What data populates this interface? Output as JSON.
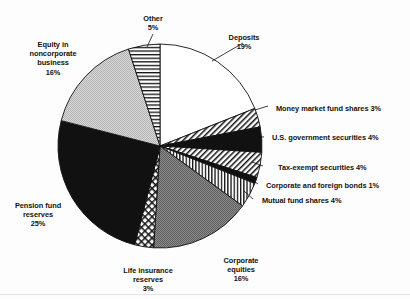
{
  "chart_data": {
    "type": "pie",
    "title": "",
    "subtitle": "",
    "xlabel": "",
    "ylabel": "",
    "legend_position": "callout-labels",
    "grid": false,
    "start_angle_deg": -90,
    "direction": "clockwise",
    "total_pct": 100,
    "categories": [
      "Deposits",
      "Money market fund shares",
      "U.S. government securities",
      "Tax-exempt securities",
      "Corporate and foreign bonds",
      "Mutual fund shares",
      "Corporate equities",
      "Life insurance reserves",
      "Pension fund reserves",
      "Equity in noncorporate business",
      "Other"
    ],
    "values": [
      19,
      3,
      4,
      4,
      1,
      4,
      16,
      3,
      25,
      16,
      5
    ],
    "value_labels": [
      "19%",
      "3%",
      "4%",
      "4%",
      "1%",
      "4%",
      "16%",
      "3%",
      "25%",
      "16%",
      "5%"
    ],
    "slice_fills": [
      "white",
      "diagonal-hatch",
      "solid-black",
      "diagonal-hatch",
      "solid-black",
      "vertical-lines",
      "mid-gray",
      "crosshatch",
      "solid-black",
      "light-gray",
      "horizontal-lines"
    ],
    "colors": {
      "white": "#ffffff",
      "light_gray": "#c9c9c9",
      "mid_gray": "#808080",
      "black": "#111111",
      "outline": "#111111"
    }
  },
  "labels": {
    "deposits": {
      "name": "Deposits",
      "pct": "19%"
    },
    "money_market": {
      "text": "Money market fund shares 3%"
    },
    "us_government": {
      "text": "U.S. government securities 4%"
    },
    "tax_exempt": {
      "text": "Tax-exempt securities 4%"
    },
    "corporate_bonds": {
      "text": "Corporate and foreign bonds 1%"
    },
    "mutual_fund": {
      "text": "Mutual fund shares 4%"
    },
    "corporate_equities": {
      "line1": "Corporate",
      "line2": "equities",
      "pct": "16%"
    },
    "life_insurance": {
      "line1": "Life insurance",
      "line2": "reserves",
      "pct": "3%"
    },
    "pension_fund": {
      "line1": "Pension fund",
      "line2": "reserves",
      "pct": "25%"
    },
    "equity_noncorporate": {
      "line1": "Equity in",
      "line2": "noncorporate",
      "line3": "business",
      "pct": "16%"
    },
    "other": {
      "name": "Other",
      "pct": "5%"
    }
  }
}
